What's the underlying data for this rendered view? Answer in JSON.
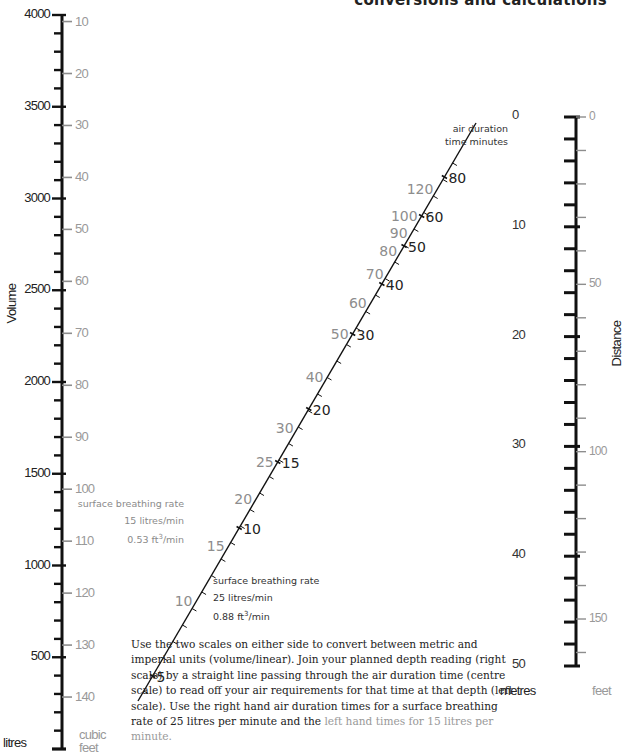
{
  "header": {
    "title": "conversions and calculations"
  },
  "left_scale": {
    "axis_title": "Volume",
    "primary_unit": "litres",
    "secondary_unit_line1": "cubic",
    "secondary_unit_line2": "feet",
    "litres_labels": [
      "4000",
      "3500",
      "3000",
      "2500",
      "2000",
      "1500",
      "1000",
      "500"
    ],
    "cubic_feet_labels": [
      "140",
      "130",
      "120",
      "110",
      "100",
      "90",
      "80",
      "70",
      "60",
      "50",
      "40",
      "30",
      "20",
      "10"
    ]
  },
  "right_scale": {
    "axis_title": "Distance",
    "primary_unit": "metres",
    "secondary_unit": "feet",
    "metres_labels": [
      "0",
      "10",
      "20",
      "30",
      "40",
      "50"
    ],
    "feet_labels": [
      "0",
      "50",
      "100",
      "150"
    ]
  },
  "center_scale": {
    "title_line1": "air duration",
    "title_line2": "time minutes",
    "rate_15": {
      "line1": "surface breathing rate",
      "line2": "15 litres/min",
      "line3_value": "0.53 ft",
      "line3_sup": "3",
      "line3_suffix": "/min"
    },
    "rate_25": {
      "line1": "surface breathing rate",
      "line2": "25 litres/min",
      "line3_value": "0.88 ft",
      "line3_sup": "3",
      "line3_suffix": "/min"
    }
  },
  "description": {
    "main": "Use the two scales on either side to convert between metric and imperial units (volume/linear). Join your planned depth reading (right scale) by a straight line passing through the air duration time (centre scale) to read off your air requirements for that time at that depth (left scale). Use the right hand air duration times for a surface breathing rate of 25 litres per minute and the ",
    "grey": "left hand times for 15 litres per minute."
  },
  "colors": {
    "ink": "#111111",
    "grey_scale": "#8d8d8d",
    "background": "#ffffff"
  },
  "chart_data": {
    "type": "nomogram",
    "title": "conversions and calculations",
    "scales": [
      {
        "name": "Volume",
        "position": "left",
        "primary": {
          "unit": "litres",
          "range": [
            0,
            4000
          ],
          "major_step": 500,
          "minor_step": 100,
          "labels": [
            500,
            1000,
            1500,
            2000,
            2500,
            3000,
            3500,
            4000
          ]
        },
        "secondary": {
          "unit": "cubic feet",
          "range": [
            0,
            141
          ],
          "step": 10,
          "labels": [
            10,
            20,
            30,
            40,
            50,
            60,
            70,
            80,
            90,
            100,
            110,
            120,
            130,
            140
          ]
        }
      },
      {
        "name": "air duration time minutes",
        "position": "centre",
        "series": [
          {
            "name": "25 litres/min (0.88 ft3/min)",
            "side": "right",
            "color": "#222222",
            "labels": [
              5,
              10,
              15,
              20,
              30,
              40,
              50,
              60,
              80
            ]
          },
          {
            "name": "15 litres/min (0.53 ft3/min)",
            "side": "left",
            "color": "#8d8d8d",
            "labels": [
              10,
              15,
              20,
              25,
              30,
              40,
              50,
              60,
              70,
              80,
              90,
              100,
              120
            ]
          }
        ]
      },
      {
        "name": "Distance",
        "position": "right",
        "primary": {
          "unit": "metres",
          "range": [
            0,
            50
          ],
          "major_step": 10,
          "minor_step": 2,
          "labels": [
            0,
            10,
            20,
            30,
            40,
            50
          ]
        },
        "secondary": {
          "unit": "feet",
          "range": [
            0,
            164
          ],
          "step": 10,
          "labels": [
            0,
            50,
            100,
            150
          ]
        }
      }
    ]
  }
}
